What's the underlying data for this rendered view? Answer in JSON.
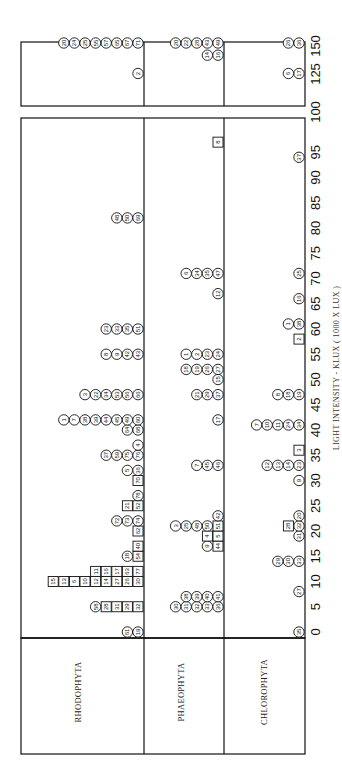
{
  "chart_data": {
    "type": "scatter",
    "orientation": "rotated-90-ccw",
    "xlabel": "LIGHT INTENSITY - KLUX ( 1000 X LUX )",
    "ylabel": "",
    "x_ticks": [
      0,
      5,
      10,
      15,
      20,
      25,
      30,
      35,
      40,
      45,
      50,
      55,
      60,
      65,
      70,
      75,
      80,
      85,
      90,
      95,
      100,
      125,
      150
    ],
    "axis_break": "between 100 and 100-150 panel",
    "legend": [],
    "marker_types": {
      "circle": "species (circle)",
      "square": "species (square)"
    },
    "divisions": [
      {
        "name": "RHODOPHYTA",
        "points": [
          {
            "x": 0,
            "labels": [
              {
                "n": "19",
                "m": "c"
              },
              {
                "n": "61",
                "m": "c"
              }
            ]
          },
          {
            "x": 5,
            "labels": [
              {
                "n": "32",
                "m": "s"
              },
              {
                "n": "29",
                "m": "s"
              },
              {
                "n": "31",
                "m": "s"
              },
              {
                "n": "28",
                "m": "s"
              },
              {
                "n": "58",
                "m": "c"
              }
            ]
          },
          {
            "x": 10,
            "labels": [
              {
                "n": "30",
                "m": "s"
              },
              {
                "n": "26",
                "m": "s"
              },
              {
                "n": "27",
                "m": "s"
              },
              {
                "n": "14",
                "m": "s"
              },
              {
                "n": "12",
                "m": "s"
              },
              {
                "n": "10",
                "m": "s"
              },
              {
                "n": "6",
                "m": "s"
              },
              {
                "n": "13",
                "m": "s"
              },
              {
                "n": "15",
                "m": "s"
              }
            ]
          },
          {
            "x": 12,
            "labels": [
              {
                "n": "77",
                "m": "s"
              },
              {
                "n": "63",
                "m": "s"
              },
              {
                "n": "17",
                "m": "s"
              },
              {
                "n": "16",
                "m": "s"
              },
              {
                "n": "11",
                "m": "s"
              }
            ]
          },
          {
            "x": 15,
            "labels": [
              {
                "n": "54",
                "m": "s"
              },
              {
                "n": "18",
                "m": "c"
              }
            ]
          },
          {
            "x": 17,
            "labels": [
              {
                "n": "40",
                "m": "s"
              }
            ]
          },
          {
            "x": 20,
            "labels": [
              {
                "n": "62",
                "m": "s"
              }
            ]
          },
          {
            "x": 22,
            "labels": [
              {
                "n": "74",
                "m": "c"
              },
              {
                "n": "73",
                "m": "c"
              },
              {
                "n": "72",
                "m": "c"
              }
            ]
          },
          {
            "x": 25,
            "labels": [
              {
                "n": "52",
                "m": "s"
              },
              {
                "n": "21",
                "m": "s"
              }
            ]
          },
          {
            "x": 27,
            "labels": [
              {
                "n": "78",
                "m": "c"
              }
            ]
          },
          {
            "x": 30,
            "labels": [
              {
                "n": "70",
                "m": "s"
              }
            ]
          },
          {
            "x": 32,
            "labels": [
              {
                "n": "36",
                "m": "c"
              },
              {
                "n": "5",
                "m": "c"
              }
            ]
          },
          {
            "x": 35,
            "labels": [
              {
                "n": "76",
                "m": "c"
              },
              {
                "n": "75",
                "m": "c"
              },
              {
                "n": "59",
                "m": "c"
              },
              {
                "n": "37",
                "m": "c"
              }
            ]
          },
          {
            "x": 37,
            "labels": [
              {
                "n": "4",
                "m": "c"
              }
            ]
          },
          {
            "x": 40,
            "labels": [
              {
                "n": "68",
                "m": "c"
              },
              {
                "n": "64",
                "m": "c"
              }
            ]
          },
          {
            "x": 42,
            "labels": [
              {
                "n": "60",
                "m": "c"
              },
              {
                "n": "49",
                "m": "c"
              },
              {
                "n": "45",
                "m": "c"
              },
              {
                "n": "44",
                "m": "c"
              },
              {
                "n": "39",
                "m": "c"
              },
              {
                "n": "38",
                "m": "c"
              },
              {
                "n": "7",
                "m": "c"
              },
              {
                "n": "1",
                "m": "c"
              }
            ]
          },
          {
            "x": 47,
            "labels": [
              {
                "n": "66",
                "m": "c"
              },
              {
                "n": "56",
                "m": "c"
              },
              {
                "n": "53",
                "m": "c"
              },
              {
                "n": "34",
                "m": "c"
              },
              {
                "n": "22",
                "m": "c"
              },
              {
                "n": "3",
                "m": "c"
              }
            ]
          },
          {
            "x": 55,
            "labels": [
              {
                "n": "43",
                "m": "c"
              },
              {
                "n": "42",
                "m": "c"
              },
              {
                "n": "9",
                "m": "c"
              },
              {
                "n": "8",
                "m": "c"
              }
            ]
          },
          {
            "x": 60,
            "labels": [
              {
                "n": "51",
                "m": "c"
              },
              {
                "n": "35",
                "m": "c"
              },
              {
                "n": "33",
                "m": "c"
              },
              {
                "n": "23",
                "m": "c"
              }
            ]
          },
          {
            "x": 82,
            "labels": [
              {
                "n": "69",
                "m": "c"
              },
              {
                "n": "50",
                "m": "c"
              },
              {
                "n": "48",
                "m": "c"
              }
            ]
          },
          {
            "x": 125,
            "labels": [
              {
                "n": "2",
                "m": "c"
              }
            ]
          },
          {
            "x": 150,
            "labels": [
              {
                "n": "71",
                "m": "c"
              },
              {
                "n": "67",
                "m": "c"
              },
              {
                "n": "65",
                "m": "c"
              },
              {
                "n": "57",
                "m": "c"
              },
              {
                "n": "55",
                "m": "c"
              },
              {
                "n": "25",
                "m": "c"
              },
              {
                "n": "24",
                "m": "c"
              },
              {
                "n": "20",
                "m": "c"
              }
            ]
          }
        ]
      },
      {
        "name": "PHAEOPHYTA",
        "points": [
          {
            "x": 5,
            "labels": [
              {
                "n": "36",
                "m": "c"
              },
              {
                "n": "33",
                "m": "c"
              },
              {
                "n": "32",
                "m": "c"
              },
              {
                "n": "31",
                "m": "c"
              },
              {
                "n": "30",
                "m": "c"
              }
            ]
          },
          {
            "x": 7,
            "labels": [
              {
                "n": "41",
                "m": "c"
              },
              {
                "n": "40",
                "m": "c"
              },
              {
                "n": "39",
                "m": "c"
              },
              {
                "n": "38",
                "m": "c"
              }
            ]
          },
          {
            "x": 17,
            "labels": [
              {
                "n": "44",
                "m": "s"
              },
              {
                "n": "9",
                "m": "c"
              }
            ]
          },
          {
            "x": 19,
            "labels": [
              {
                "n": "5",
                "m": "s"
              },
              {
                "n": "4",
                "m": "s"
              }
            ]
          },
          {
            "x": 21,
            "labels": [
              {
                "n": "51",
                "m": "s"
              },
              {
                "n": "50",
                "m": "c"
              },
              {
                "n": "48",
                "m": "c"
              },
              {
                "n": "25",
                "m": "c"
              },
              {
                "n": "3",
                "m": "c"
              }
            ]
          },
          {
            "x": 23,
            "labels": [
              {
                "n": "42",
                "m": "c"
              }
            ]
          },
          {
            "x": 33,
            "labels": [
              {
                "n": "46",
                "m": "c"
              },
              {
                "n": "45",
                "m": "c"
              },
              {
                "n": "7",
                "m": "c"
              }
            ]
          },
          {
            "x": 42,
            "labels": [
              {
                "n": "17",
                "m": "c"
              }
            ]
          },
          {
            "x": 47,
            "labels": [
              {
                "n": "37",
                "m": "c"
              },
              {
                "n": "29",
                "m": "c"
              },
              {
                "n": "21",
                "m": "c"
              }
            ]
          },
          {
            "x": 50,
            "labels": [
              {
                "n": "15",
                "m": "c"
              }
            ]
          },
          {
            "x": 52,
            "labels": [
              {
                "n": "27",
                "m": "c"
              },
              {
                "n": "26",
                "m": "c"
              },
              {
                "n": "19",
                "m": "c"
              },
              {
                "n": "18",
                "m": "c"
              }
            ]
          },
          {
            "x": 55,
            "labels": [
              {
                "n": "24",
                "m": "c"
              },
              {
                "n": "23",
                "m": "c"
              },
              {
                "n": "2",
                "m": "c"
              },
              {
                "n": "1",
                "m": "c"
              }
            ]
          },
          {
            "x": 67,
            "labels": [
              {
                "n": "12",
                "m": "c"
              }
            ]
          },
          {
            "x": 71,
            "labels": [
              {
                "n": "47",
                "m": "c"
              },
              {
                "n": "35",
                "m": "c"
              },
              {
                "n": "34",
                "m": "c"
              },
              {
                "n": "6",
                "m": "c"
              }
            ]
          },
          {
            "x": 97,
            "labels": [
              {
                "n": "8",
                "m": "s"
              }
            ]
          },
          {
            "x": 140,
            "labels": [
              {
                "n": "16",
                "m": "c"
              },
              {
                "n": "14",
                "m": "c"
              }
            ]
          },
          {
            "x": 150,
            "labels": [
              {
                "n": "49",
                "m": "c"
              },
              {
                "n": "43",
                "m": "c"
              },
              {
                "n": "28",
                "m": "c"
              },
              {
                "n": "22",
                "m": "c"
              },
              {
                "n": "20",
                "m": "c"
              }
            ]
          }
        ]
      },
      {
        "name": "CHLOROPHYTA",
        "points": [
          {
            "x": 0,
            "labels": [
              {
                "n": "35",
                "m": "c"
              }
            ]
          },
          {
            "x": 8,
            "labels": [
              {
                "n": "27",
                "m": "c"
              }
            ]
          },
          {
            "x": 14,
            "labels": [
              {
                "n": "33",
                "m": "c"
              },
              {
                "n": "30",
                "m": "c"
              },
              {
                "n": "29",
                "m": "c"
              }
            ]
          },
          {
            "x": 19,
            "labels": [
              {
                "n": "31",
                "m": "c"
              }
            ]
          },
          {
            "x": 21,
            "labels": [
              {
                "n": "32",
                "m": "c"
              },
              {
                "n": "28",
                "m": "s"
              }
            ]
          },
          {
            "x": 23,
            "labels": [
              {
                "n": "20",
                "m": "c"
              }
            ]
          },
          {
            "x": 30,
            "labels": [
              {
                "n": "9",
                "m": "c"
              }
            ]
          },
          {
            "x": 33,
            "labels": [
              {
                "n": "23",
                "m": "c"
              },
              {
                "n": "14",
                "m": "c"
              },
              {
                "n": "13",
                "m": "c"
              },
              {
                "n": "12",
                "m": "c"
              }
            ]
          },
          {
            "x": 36,
            "labels": [
              {
                "n": "3",
                "m": "s"
              }
            ]
          },
          {
            "x": 41,
            "labels": [
              {
                "n": "34",
                "m": "c"
              },
              {
                "n": "24",
                "m": "c"
              },
              {
                "n": "11",
                "m": "c"
              },
              {
                "n": "10",
                "m": "c"
              },
              {
                "n": "7",
                "m": "c"
              }
            ]
          },
          {
            "x": 47,
            "labels": [
              {
                "n": "19",
                "m": "c"
              },
              {
                "n": "18",
                "m": "c"
              },
              {
                "n": "8",
                "m": "c"
              }
            ]
          },
          {
            "x": 58,
            "labels": [
              {
                "n": "2",
                "m": "s"
              }
            ]
          },
          {
            "x": 61,
            "labels": [
              {
                "n": "38",
                "m": "c"
              },
              {
                "n": "1",
                "m": "c"
              }
            ]
          },
          {
            "x": 66,
            "labels": [
              {
                "n": "16",
                "m": "c"
              }
            ]
          },
          {
            "x": 71,
            "labels": [
              {
                "n": "25",
                "m": "c"
              }
            ]
          },
          {
            "x": 94,
            "labels": [
              {
                "n": "37",
                "m": "c"
              }
            ]
          },
          {
            "x": 125,
            "labels": [
              {
                "n": "17",
                "m": "c"
              },
              {
                "n": "6",
                "m": "c"
              }
            ]
          },
          {
            "x": 150,
            "labels": [
              {
                "n": "36",
                "m": "c"
              },
              {
                "n": "26",
                "m": "c"
              }
            ]
          }
        ]
      }
    ]
  }
}
